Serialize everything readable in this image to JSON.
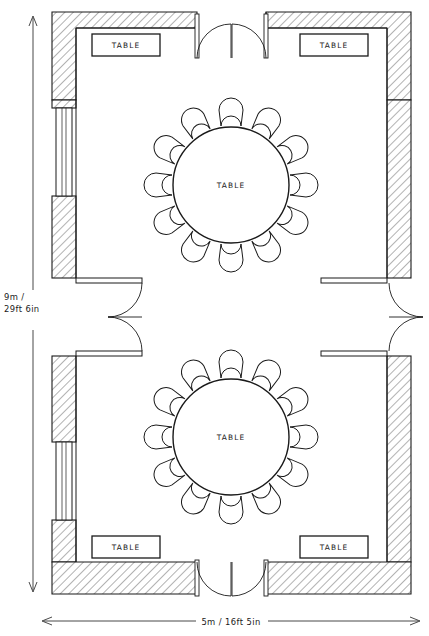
{
  "drawing": {
    "type": "architectural-floor-plan",
    "title": "Banquet room floor plan",
    "style": "hand-drawn pencil line drawing, hatched walls"
  },
  "dimensions": {
    "vertical": {
      "label": "9m /\n29ft 6in",
      "line1": "9m /",
      "line2": "29ft 6in",
      "metric": "9m",
      "imperial": "29ft 6in",
      "orientation": "vertical",
      "position": "left"
    },
    "horizontal": {
      "label": "5m / 16ft 5in",
      "metric": "5m",
      "imperial": "16ft 5in",
      "orientation": "horizontal",
      "position": "bottom"
    }
  },
  "rooms": [
    {
      "id": "upper-room",
      "name": "Upper room"
    },
    {
      "id": "lower-room",
      "name": "Lower room"
    }
  ],
  "rect_tables": [
    {
      "id": "table-top-left",
      "label": "TABLE",
      "room": "upper-room",
      "position": "top-left"
    },
    {
      "id": "table-top-right",
      "label": "TABLE",
      "room": "upper-room",
      "position": "top-right"
    },
    {
      "id": "table-bottom-left",
      "label": "TABLE",
      "room": "lower-room",
      "position": "bottom-left"
    },
    {
      "id": "table-bottom-right",
      "label": "TABLE",
      "room": "lower-room",
      "position": "bottom-right"
    }
  ],
  "round_tables": [
    {
      "id": "round-table-upper",
      "label": "TABLE",
      "room": "upper-room",
      "seats": 12
    },
    {
      "id": "round-table-lower",
      "label": "TABLE",
      "room": "lower-room",
      "seats": 12
    }
  ],
  "doors": [
    {
      "id": "door-top",
      "kind": "double-swing",
      "location": "top wall, center"
    },
    {
      "id": "door-bottom",
      "kind": "double-swing",
      "location": "bottom wall, center"
    },
    {
      "id": "door-middle-left",
      "kind": "double-swing",
      "location": "left middle gap"
    },
    {
      "id": "door-middle-right",
      "kind": "double-swing",
      "location": "right middle gap"
    }
  ],
  "windows": [
    {
      "id": "window-upper-left",
      "location": "left wall, upper room"
    },
    {
      "id": "window-lower-left",
      "location": "left wall, lower room"
    }
  ],
  "colors": {
    "line": "#1a1a1a",
    "hatch": "#4a4a4a",
    "paper": "#ffffff",
    "dimension": "#2a2a2a"
  }
}
